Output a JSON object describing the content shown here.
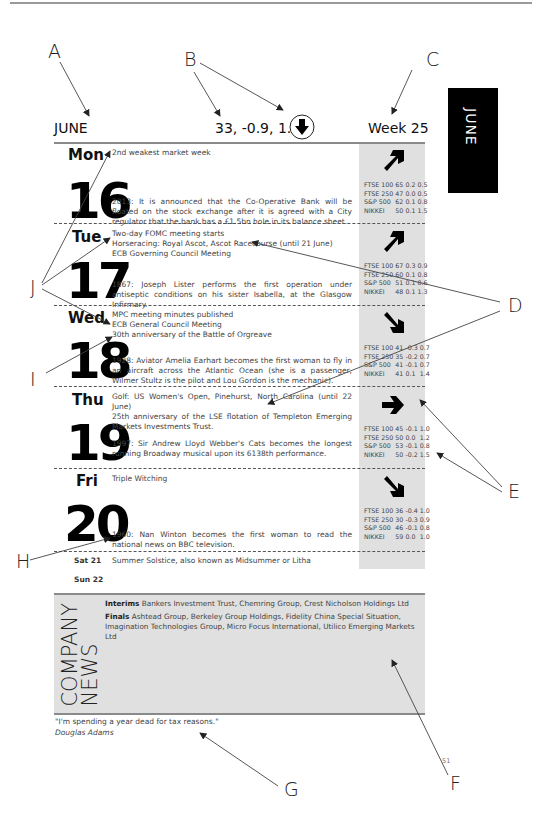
{
  "callouts": {
    "A": "A",
    "B": "B",
    "C": "C",
    "D": "D",
    "E": "E",
    "F": "F",
    "G": "G",
    "H": "H",
    "I": "I",
    "J": "J"
  },
  "header": {
    "month": "JUNE",
    "market_summary": "33, -0.9, 1.8",
    "market_direction_icon": "arrow-down-circle-icon",
    "week": "Week 25",
    "side_tab": "JUNE"
  },
  "days": [
    {
      "name": "Mon",
      "number": "16",
      "events": [
        "2nd weakest market week"
      ],
      "history": "2013: It is announced that the Co-Operative Bank will be floated on the stock exchange after it is agreed with a City regulator that the bank has a £1.5bn hole in its balance sheet.",
      "trend_icon": "arrow-up-right-icon",
      "stats": [
        {
          "index": "FTSE 100",
          "a": "65",
          "b": "0.2",
          "c": "0.5"
        },
        {
          "index": "FTSE 250",
          "a": "47",
          "b": "0.0",
          "c": "0.5"
        },
        {
          "index": "S&P 500",
          "a": "62",
          "b": "0.1",
          "c": "0.8"
        },
        {
          "index": "NIKKEI",
          "a": "50",
          "b": "0.1",
          "c": "1.5"
        }
      ]
    },
    {
      "name": "Tue",
      "number": "17",
      "events": [
        "Two-day FOMC meeting starts",
        "Horseracing: Royal Ascot, Ascot Racecourse (until 21 June)",
        "ECB Governing Council Meeting"
      ],
      "history": "1867: Joseph Lister performs the first operation under antiseptic conditions on his sister Isabella, at the Glasgow Infirmary.",
      "trend_icon": "arrow-up-right-icon",
      "stats": [
        {
          "index": "FTSE 100",
          "a": "67",
          "b": "0.3",
          "c": "0.9"
        },
        {
          "index": "FTSE 250",
          "a": "60",
          "b": "0.1",
          "c": "0.8"
        },
        {
          "index": "S&P 500",
          "a": "51",
          "b": "0.1",
          "c": "0.6"
        },
        {
          "index": "NIKKEI",
          "a": "48",
          "b": "0.1",
          "c": "1.3"
        }
      ]
    },
    {
      "name": "Wed",
      "number": "18",
      "events": [
        "MPC meeting minutes published",
        "ECB General Council Meeting",
        "30th anniversary of the Battle of Orgreave"
      ],
      "history": "1928: Aviator Amelia Earhart becomes the first woman to fly in an aircraft across the Atlantic Ocean (she is a passenger, Wilmer Stultz is the pilot and Lou Gordon is the mechanic).",
      "trend_icon": "arrow-down-right-icon",
      "stats": [
        {
          "index": "FTSE 100",
          "a": "41",
          "b": "-0.3",
          "c": "0.7"
        },
        {
          "index": "FTSE 250",
          "a": "35",
          "b": "-0.2",
          "c": "0.7"
        },
        {
          "index": "S&P 500",
          "a": "41",
          "b": "-0.1",
          "c": "0.7"
        },
        {
          "index": "NIKKEI",
          "a": "41",
          "b": "0.1",
          "c": "1.4"
        }
      ]
    },
    {
      "name": "Thu",
      "number": "19",
      "events": [
        "Golf: US Women's Open, Pinehurst, North Carolina (until 22 June)",
        "25th anniversary of the LSE flotation of Templeton Emerging Markets Investments Trust."
      ],
      "history": "1997: Sir Andrew Lloyd Webber's Cats becomes the longest running Broadway musical upon its 6138th performance.",
      "trend_icon": "arrow-right-icon",
      "stats": [
        {
          "index": "FTSE 100",
          "a": "45",
          "b": "-0.1",
          "c": "1.0"
        },
        {
          "index": "FTSE 250",
          "a": "50",
          "b": "0.0",
          "c": "1.2"
        },
        {
          "index": "S&P 500",
          "a": "53",
          "b": "-0.1",
          "c": "0.8"
        },
        {
          "index": "NIKKEI",
          "a": "50",
          "b": "-0.2",
          "c": "1.5"
        }
      ]
    },
    {
      "name": "Fri",
      "number": "20",
      "events": [
        "Triple Witching"
      ],
      "history": "1960: Nan Winton becomes the first woman to read the national news on BBC television.",
      "trend_icon": "arrow-down-right-icon",
      "stats": [
        {
          "index": "FTSE 100",
          "a": "36",
          "b": "-0.4",
          "c": "1.0"
        },
        {
          "index": "FTSE 250",
          "a": "30",
          "b": "-0.3",
          "c": "0.9"
        },
        {
          "index": "S&P 500",
          "a": "46",
          "b": "-0.1",
          "c": "0.8"
        },
        {
          "index": "NIKKEI",
          "a": "59",
          "b": "0.0",
          "c": "1.0"
        }
      ]
    }
  ],
  "weekend": [
    {
      "label": "Sat 21",
      "text": "Summer Solstice, also known as Midsummer or Litha"
    },
    {
      "label": "Sun 22",
      "text": ""
    }
  ],
  "company_news": {
    "title_line1": "COMPANY",
    "title_line2": "NEWS",
    "interims_label": "Interims",
    "interims": "Bankers Investment Trust, Chemring Group, Crest Nicholson Holdings Ltd",
    "finals_label": "Finals",
    "finals": "Ashtead Group, Berkeley Group Holdings, Fidelity China Special Situation, Imagination Technologies Group, Micro Focus International, Utilico Emerging Markets Ltd"
  },
  "quote": {
    "text": "\"I'm spending a year dead for tax reasons.\"",
    "author": "Douglas Adams"
  },
  "page_number": "51"
}
